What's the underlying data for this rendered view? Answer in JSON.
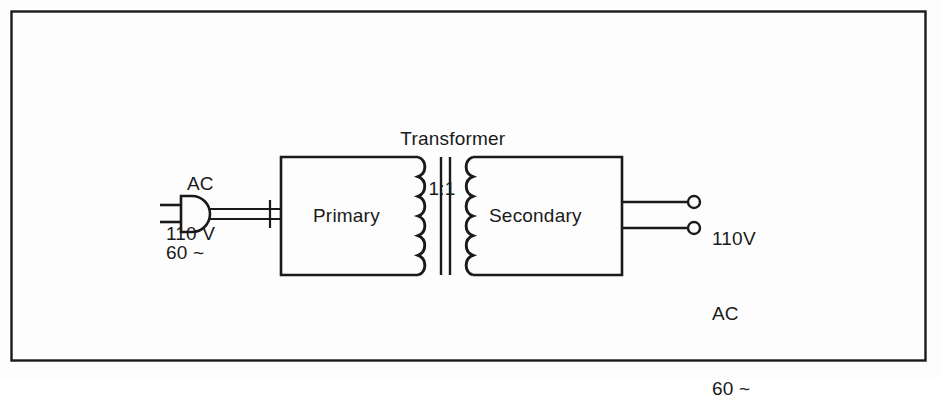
{
  "figure": {
    "background_color": "#fdfdfd",
    "line_color": "#1a1a1a",
    "border": {
      "name": "figure-border",
      "x": 11,
      "y": 11,
      "width": 915,
      "height": 350
    }
  },
  "transformer": {
    "label_line1": "Transformer",
    "label_line2": "1:1",
    "ratio": "1:1",
    "core_bars": 2,
    "primary_label": "Primary",
    "secondary_label": "Secondary",
    "primary_coil_turns": 6,
    "secondary_coil_turns": 6
  },
  "input": {
    "line1": "AC",
    "line2": "110 V",
    "line3": "60 ~",
    "voltage": "110 V",
    "frequency": "60 ~",
    "type": "AC",
    "plug_icon": "ac-plug-icon",
    "cord_conductors": 2
  },
  "output": {
    "line1": "110V",
    "line2": "AC",
    "line3": "60 ~",
    "voltage": "110V",
    "frequency": "60 ~",
    "type": "AC",
    "terminal_count": 2,
    "terminal_icon": "open-circle-terminal-icon"
  }
}
